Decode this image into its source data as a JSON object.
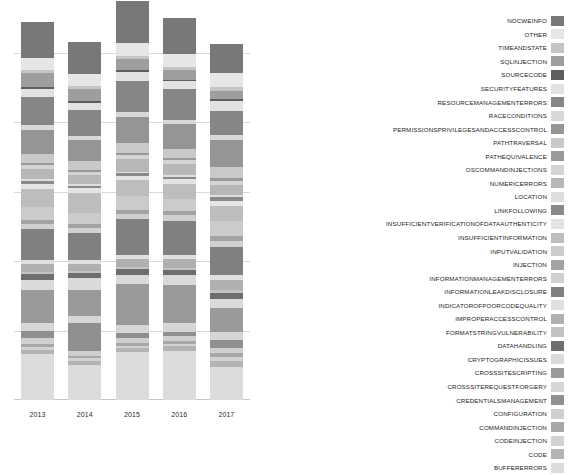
{
  "chart_data": {
    "type": "bar",
    "title": "",
    "subtitle": "",
    "xlabel": "",
    "ylabel": "",
    "stacked": true,
    "grid": true,
    "legend_position": "right",
    "categories": [
      "2013",
      "2014",
      "2015",
      "2016",
      "2017"
    ],
    "xtick_labels": [
      "2013",
      "2014",
      "2015",
      "2016",
      "2017"
    ],
    "ytick_labels": [],
    "ylim": [
      0,
      100
    ],
    "gridline_values": [
      18,
      36,
      54,
      72,
      90
    ],
    "series": [
      {
        "name": "BUFFERERRORS",
        "color": "#dcdcdc",
        "values": [
          11.8,
          9.2,
          12.5,
          12.8,
          8.6
        ]
      },
      {
        "name": "CODE",
        "color": "#b4b4b4",
        "values": [
          1.1,
          1.0,
          0.9,
          1.1,
          1.6
        ]
      },
      {
        "name": "CODEINJECTION",
        "color": "#d2d2d2",
        "values": [
          0.8,
          0.6,
          0.7,
          0.6,
          0.9
        ]
      },
      {
        "name": "COMMANDINJECTION",
        "color": "#a8a8a8",
        "values": [
          0.9,
          0.7,
          0.8,
          0.7,
          1.0
        ]
      },
      {
        "name": "CONFIGURATION",
        "color": "#cfcfcf",
        "values": [
          1.4,
          1.2,
          1.1,
          1.3,
          1.5
        ]
      },
      {
        "name": "CREDENTIALSMANAGEMENT",
        "color": "#8f8f8f",
        "values": [
          1.8,
          7.2,
          1.4,
          1.2,
          1.9
        ]
      },
      {
        "name": "CROSSSITEREQUESTFORGERY",
        "color": "#d6d6d6",
        "values": [
          2.2,
          2.0,
          2.1,
          2.3,
          2.0
        ]
      },
      {
        "name": "CROSSSITESCRIPTING",
        "color": "#9a9a9a",
        "values": [
          8.4,
          6.6,
          10.5,
          9.8,
          6.4
        ]
      },
      {
        "name": "CRYPTOGRAPHICISSUES",
        "color": "#dadada",
        "values": [
          2.6,
          3.0,
          2.4,
          2.6,
          2.2
        ]
      },
      {
        "name": "DATAHANDLING",
        "color": "#6e6e6e",
        "values": [
          1.6,
          1.4,
          1.5,
          1.3,
          1.7
        ]
      },
      {
        "name": "FORMATSTRINGVULNERABILITY",
        "color": "#c2c2c2",
        "values": [
          0.6,
          0.5,
          0.5,
          0.5,
          0.6
        ]
      },
      {
        "name": "IMPROPERACCESSCONTROL",
        "color": "#b0b0b0",
        "values": [
          2.0,
          1.8,
          2.2,
          2.4,
          2.6
        ]
      },
      {
        "name": "INDICATOROFPOORCODEQUALITY",
        "color": "#e0e0e0",
        "values": [
          1.2,
          1.1,
          1.0,
          1.1,
          1.3
        ]
      },
      {
        "name": "INFORMATIONLEAKDISCLOSURE",
        "color": "#808080",
        "values": [
          7.8,
          7.0,
          9.2,
          8.8,
          7.4
        ]
      },
      {
        "name": "INFORMATIONMANAGEMENTERRORS",
        "color": "#d0d0d0",
        "values": [
          1.5,
          1.3,
          1.4,
          1.5,
          1.6
        ]
      },
      {
        "name": "INJECTION",
        "color": "#a3a3a3",
        "values": [
          1.0,
          0.9,
          1.1,
          1.0,
          1.2
        ]
      },
      {
        "name": "INPUTVALIDATION",
        "color": "#cbcbcb",
        "values": [
          3.4,
          3.0,
          3.6,
          3.2,
          3.8
        ]
      },
      {
        "name": "INSUFFICIENTINFORMATION",
        "color": "#bdbdbd",
        "values": [
          4.6,
          5.2,
          4.2,
          3.8,
          4.0
        ]
      },
      {
        "name": "INSUFFICIENTVERIFICATIONOFDATAAUTHENTICITY",
        "color": "#e4e4e4",
        "values": [
          1.3,
          1.2,
          1.1,
          1.2,
          1.4
        ]
      },
      {
        "name": "LINKFOLLOWING",
        "color": "#8a8a8a",
        "values": [
          0.7,
          0.6,
          0.6,
          0.6,
          0.8
        ]
      },
      {
        "name": "LOCATION",
        "color": "#dedede",
        "values": [
          0.5,
          0.5,
          0.4,
          0.5,
          0.6
        ]
      },
      {
        "name": "NUMERICERRORS",
        "color": "#b7b7b7",
        "values": [
          2.8,
          2.4,
          3.2,
          3.0,
          2.6
        ]
      },
      {
        "name": "OSCOMMANDINJECTIONS",
        "color": "#d4d4d4",
        "values": [
          0.9,
          0.8,
          1.0,
          0.9,
          1.1
        ]
      },
      {
        "name": "PATHEQUIVALENCE",
        "color": "#999999",
        "values": [
          0.6,
          0.5,
          0.6,
          0.5,
          0.7
        ]
      },
      {
        "name": "PATHTRAVERSAL",
        "color": "#c9c9c9",
        "values": [
          2.4,
          2.2,
          2.6,
          2.5,
          2.8
        ]
      },
      {
        "name": "PERMISSIONSPRIVILEGESANDACCESSCONTROL",
        "color": "#959595",
        "values": [
          6.2,
          5.6,
          6.8,
          6.4,
          7.2
        ]
      },
      {
        "name": "RACECONDITIONS",
        "color": "#d8d8d8",
        "values": [
          1.1,
          1.0,
          1.2,
          1.1,
          1.3
        ]
      },
      {
        "name": "RESOURCEMANAGEMENTERRORS",
        "color": "#868686",
        "values": [
          7.4,
          6.8,
          8.2,
          7.8,
          6.2
        ]
      },
      {
        "name": "SECURITYFEATURES",
        "color": "#e2e2e2",
        "values": [
          2.0,
          1.8,
          2.2,
          2.1,
          2.4
        ]
      },
      {
        "name": "SOURCECODE",
        "color": "#5e5e5e",
        "values": [
          0.5,
          0.4,
          0.5,
          0.4,
          0.6
        ]
      },
      {
        "name": "SQLINJECTION",
        "color": "#9e9e9e",
        "values": [
          3.6,
          3.2,
          2.8,
          2.6,
          2.2
        ]
      },
      {
        "name": "TIMEANDSTATE",
        "color": "#c5c5c5",
        "values": [
          0.8,
          0.7,
          0.9,
          0.8,
          1.0
        ]
      },
      {
        "name": "OTHER",
        "color": "#e6e6e6",
        "values": [
          3.2,
          3.0,
          3.4,
          3.2,
          3.6
        ]
      },
      {
        "name": "NOCWEINFO",
        "color": "#787878",
        "values": [
          9.2,
          8.4,
          10.8,
          9.4,
          7.6
        ]
      }
    ]
  },
  "legend": {
    "entries": [
      {
        "label": "NOCWEINFO",
        "color": "#787878"
      },
      {
        "label": "OTHER",
        "color": "#e6e6e6"
      },
      {
        "label": "TIMEANDSTATE",
        "color": "#c5c5c5"
      },
      {
        "label": "SQLINJECTION",
        "color": "#9e9e9e"
      },
      {
        "label": "SOURCECODE",
        "color": "#5e5e5e"
      },
      {
        "label": "SECURITYFEATURES",
        "color": "#e2e2e2"
      },
      {
        "label": "RESOURCEMANAGEMENTERRORS",
        "color": "#868686"
      },
      {
        "label": "RACECONDITIONS",
        "color": "#d8d8d8"
      },
      {
        "label": "PERMISSIONSPRIVILEGESANDACCESSCONTROL",
        "color": "#959595"
      },
      {
        "label": "PATHTRAVERSAL",
        "color": "#c9c9c9"
      },
      {
        "label": "PATHEQUIVALENCE",
        "color": "#999999"
      },
      {
        "label": "OSCOMMANDINJECTIONS",
        "color": "#d4d4d4"
      },
      {
        "label": "NUMERICERRORS",
        "color": "#b7b7b7"
      },
      {
        "label": "LOCATION",
        "color": "#dedede"
      },
      {
        "label": "LINKFOLLOWING",
        "color": "#8a8a8a"
      },
      {
        "label": "INSUFFICIENTVERIFICATIONOFDATAAUTHENTICITY",
        "color": "#e4e4e4"
      },
      {
        "label": "INSUFFICIENTINFORMATION",
        "color": "#bdbdbd"
      },
      {
        "label": "INPUTVALIDATION",
        "color": "#cbcbcb"
      },
      {
        "label": "INJECTION",
        "color": "#a3a3a3"
      },
      {
        "label": "INFORMATIONMANAGEMENTERRORS",
        "color": "#d0d0d0"
      },
      {
        "label": "INFORMATIONLEAKDISCLOSURE",
        "color": "#808080"
      },
      {
        "label": "INDICATOROFPOORCODEQUALITY",
        "color": "#e0e0e0"
      },
      {
        "label": "IMPROPERACCESSCONTROL",
        "color": "#b0b0b0"
      },
      {
        "label": "FORMATSTRINGVULNERABILITY",
        "color": "#c2c2c2"
      },
      {
        "label": "DATAHANDLING",
        "color": "#6e6e6e"
      },
      {
        "label": "CRYPTOGRAPHICISSUES",
        "color": "#dadada"
      },
      {
        "label": "CROSSSITESCRIPTING",
        "color": "#9a9a9a"
      },
      {
        "label": "CROSSSITEREQUESTFORGERY",
        "color": "#d6d6d6"
      },
      {
        "label": "CREDENTIALSMANAGEMENT",
        "color": "#8f8f8f"
      },
      {
        "label": "CONFIGURATION",
        "color": "#cfcfcf"
      },
      {
        "label": "COMMANDINJECTION",
        "color": "#a8a8a8"
      },
      {
        "label": "CODEINJECTION",
        "color": "#d2d2d2"
      },
      {
        "label": "CODE",
        "color": "#b4b4b4"
      },
      {
        "label": "BUFFERERRORS",
        "color": "#dcdcdc"
      }
    ]
  }
}
